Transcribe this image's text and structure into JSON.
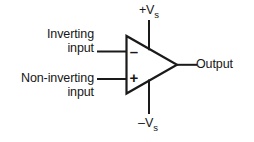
{
  "diagram": {
    "stroke_color": "#1a1a1a",
    "text_color": "#161616",
    "background_color": "#ffffff",
    "labels": {
      "inverting_input_line1": "Inverting",
      "inverting_input_line2": "input",
      "noninverting_input_line1": "Non-inverting",
      "noninverting_input_line2": "input",
      "output": "Output",
      "supply_positive_main": "+V",
      "supply_positive_sub": "s",
      "supply_negative_main": "–V",
      "supply_negative_sub": "s"
    },
    "terminal_signs": {
      "inverting": "–",
      "noninverting": "+"
    }
  }
}
